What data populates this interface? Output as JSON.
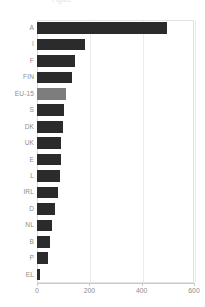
{
  "figure": {
    "title_fragment": "Figure"
  },
  "chart_data": {
    "type": "bar",
    "orientation": "horizontal",
    "title": "",
    "xlabel": "",
    "ylabel": "",
    "xlim": [
      0,
      600
    ],
    "xticks": [
      0,
      200,
      400,
      600
    ],
    "xtick_labels": [
      "0",
      "200",
      "400",
      "600"
    ],
    "grid": true,
    "grid_axis": "x",
    "legend": "none",
    "categories": [
      "A",
      "I",
      "F",
      "FIN",
      "EU-15",
      "S",
      "DK",
      "UK",
      "E",
      "L",
      "IRL",
      "D",
      "NL",
      "B",
      "P",
      "EL"
    ],
    "values": [
      497,
      183,
      145,
      134,
      111,
      103,
      99,
      92,
      92,
      88,
      80,
      69,
      57,
      50,
      42,
      11
    ],
    "highlight_category": "EU-15",
    "colors": {
      "bar": "#2b2b2b",
      "highlight_bar": "#7d7d7d",
      "grid": "#ececec",
      "frame": "#e2e2e2",
      "axis": "#c9c9c9",
      "text": "#8c8c8c",
      "background": "#ffffff"
    }
  }
}
